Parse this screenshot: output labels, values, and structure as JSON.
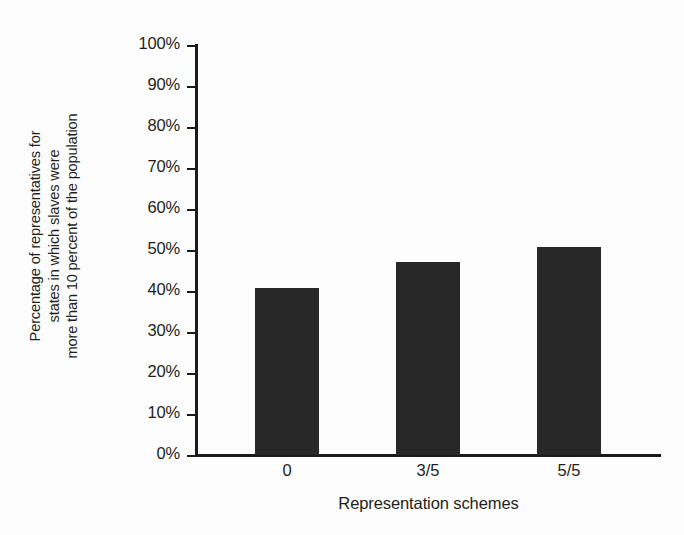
{
  "chart_data": {
    "type": "bar",
    "title": "",
    "categories": [
      "0",
      "3/5",
      "5/5"
    ],
    "values": [
      40.7,
      47.0,
      50.7
    ],
    "series": [
      {
        "name": "Percentage of representatives",
        "values": [
          40.7,
          47.0,
          50.7
        ]
      }
    ],
    "xlabel": "Representation schemes",
    "ylabel": "Percentage of representatives for states in which slaves were more than 10 percent of the population",
    "ylabel_lines": [
      "Percentage of representatives for",
      "states in which slaves were",
      "more than 10 percent of the population"
    ],
    "ylim": [
      0,
      100
    ],
    "xlim_categories": 3,
    "ytick_labels": [
      "100%",
      "90%",
      "80%",
      "70%",
      "60%",
      "50%",
      "40%",
      "30%",
      "20%",
      "10%",
      "0%"
    ],
    "ytick_values": [
      100,
      90,
      80,
      70,
      60,
      50,
      40,
      30,
      20,
      10,
      0
    ],
    "yticks_step": 10,
    "grid": false,
    "legend": false,
    "legend_position": "none",
    "bar_color": "#272727",
    "axis_color": "#1a1a1a",
    "background_color": "#fdfdfd",
    "text_color": "#231f20",
    "data_labels_shown": false,
    "bars": [
      {
        "category": "0",
        "value": 40.7,
        "label": "0"
      },
      {
        "category": "3/5",
        "value": 47.0,
        "label": "3/5"
      },
      {
        "category": "5/5",
        "value": 50.7,
        "label": "5/5"
      }
    ]
  }
}
